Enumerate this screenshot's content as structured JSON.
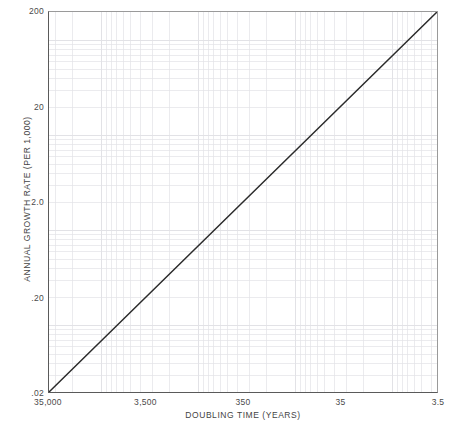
{
  "chart_data": {
    "type": "line",
    "title": "",
    "xlabel": "DOUBLING TIME (YEARS)",
    "ylabel": "ANNUAL GROWTH RATE (PER 1,000)",
    "x_scale": "log-reversed",
    "y_scale": "log",
    "xlim": [
      35000,
      3.5
    ],
    "ylim": [
      0.02,
      200
    ],
    "grid": true,
    "legend": "none",
    "x_ticks": [
      {
        "value": 35000,
        "label": "35,000"
      },
      {
        "value": 3500,
        "label": "3,500"
      },
      {
        "value": 350,
        "label": "350"
      },
      {
        "value": 35,
        "label": "35"
      },
      {
        "value": 3.5,
        "label": "3.5"
      }
    ],
    "y_ticks": [
      {
        "value": 200,
        "label": "200"
      },
      {
        "value": 20,
        "label": "20"
      },
      {
        "value": 2.0,
        "label": "2.0"
      },
      {
        "value": 0.2,
        "label": ".20"
      },
      {
        "value": 0.02,
        "label": ".02"
      }
    ],
    "series": [
      {
        "name": "doubling-time-vs-growth-rate",
        "color": "#2b2b2b",
        "width": 1.5,
        "points": [
          {
            "x": 35000,
            "y": 0.02
          },
          {
            "x": 3500,
            "y": 0.2
          },
          {
            "x": 350,
            "y": 2.0
          },
          {
            "x": 35,
            "y": 20
          },
          {
            "x": 3.5,
            "y": 200
          }
        ]
      }
    ],
    "annotations": [],
    "grid_color": "#e2e2e6",
    "axis_color": "#5a5a5a",
    "background": "#ffffff"
  }
}
